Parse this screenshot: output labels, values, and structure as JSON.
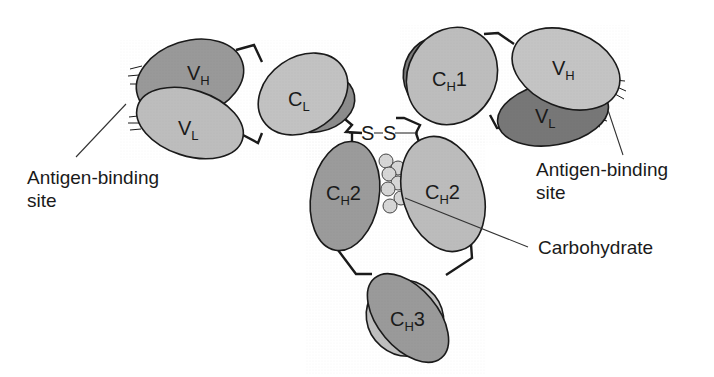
{
  "diagram": {
    "colors": {
      "dark": "#8c8c8c",
      "medium": "#a6a6a6",
      "light": "#c4c4c4",
      "outline": "#1a1a1a",
      "carbohydrate": "#d6d6d6"
    },
    "domains": {
      "left_vh": {
        "main": "V",
        "sub": "H"
      },
      "left_vl": {
        "main": "V",
        "sub": "L"
      },
      "left_cl": {
        "main": "C",
        "sub": "L"
      },
      "right_ch1": {
        "main": "C",
        "sub": "H",
        "suffix": "1"
      },
      "right_vh": {
        "main": "V",
        "sub": "H"
      },
      "right_vl": {
        "main": "V",
        "sub": "L"
      },
      "left_ch2": {
        "main": "C",
        "sub": "H",
        "suffix": "2"
      },
      "right_ch2": {
        "main": "C",
        "sub": "H",
        "suffix": "2"
      },
      "ch3": {
        "main": "C",
        "sub": "H",
        "suffix": "3"
      }
    },
    "disulfide_label": "S–S",
    "labels": {
      "antigen_left_line1": "Antigen-binding",
      "antigen_left_line2": "site",
      "antigen_right_line1": "Antigen-binding",
      "antigen_right_line2": "site",
      "carbohydrate": "Carbohydrate"
    }
  }
}
